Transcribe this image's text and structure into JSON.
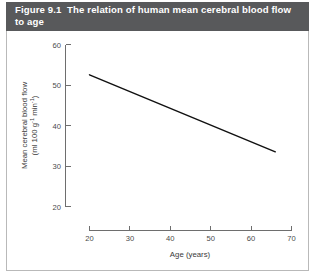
{
  "figure": {
    "title": "Figure 9.1  The relation of human mean cerebral blood flow to age",
    "title_bar_color": "#58595b",
    "title_text_color": "#ffffff",
    "panel_background": "#ffffff",
    "panel_border_color": "#b9b9b9"
  },
  "chart_data": {
    "type": "line",
    "title": "Figure 9.1  The relation of human mean cerebral blood flow to age",
    "subtitle": "",
    "xlabel": "Age (years)",
    "ylabel": "Mean cerebral blood flow (ml 100 g⁻¹ min⁻¹)",
    "ylabel_line1": "Mean cerebral blood flow",
    "ylabel_line2_prefix": "(ml 100 g",
    "ylabel_line2_sup1": "-1",
    "ylabel_line2_mid": " min",
    "ylabel_line2_sup2": "-1",
    "ylabel_line2_suffix": ")",
    "xlim": [
      20,
      70
    ],
    "ylim": [
      20,
      60
    ],
    "xticks": [
      20,
      30,
      40,
      50,
      60,
      70
    ],
    "yticks": [
      20,
      30,
      40,
      50,
      60
    ],
    "xtick_labels": [
      "20",
      "30",
      "40",
      "50",
      "60",
      "70"
    ],
    "ytick_labels": [
      "20",
      "30",
      "40",
      "50",
      "60"
    ],
    "grid": false,
    "legend": false,
    "legend_position": "none",
    "line_color": "#111111",
    "series": [
      {
        "name": "Mean cerebral blood flow",
        "x": [
          20,
          66
        ],
        "values": [
          52.5,
          33.5
        ]
      }
    ]
  }
}
